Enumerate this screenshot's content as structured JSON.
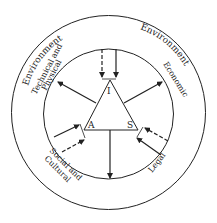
{
  "diagram": {
    "outer_ring_labels": {
      "left": "Environment",
      "right": "Environment"
    },
    "inner_sector_labels": {
      "technical_line1": "Technical and",
      "technical_line2": "Physical",
      "economic": "Economic",
      "social_line1": "Social and",
      "social_line2": "Cultural",
      "legal": "Legal"
    },
    "triangle_vertices": {
      "top": "I",
      "left": "A",
      "right": "S"
    },
    "colors": {
      "stroke": "#222222",
      "background": "#ffffff"
    }
  }
}
